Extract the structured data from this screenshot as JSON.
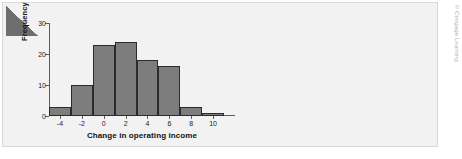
{
  "figure": {
    "credit": "© Cengage Learning",
    "corner_icon": "corner-wedge-icon"
  },
  "chart_data": {
    "type": "bar",
    "title": "",
    "subtitle": "",
    "xlabel": "Change in operating income",
    "ylabel": "Frequency",
    "categories": [
      "-5 to -3",
      "-3 to -1",
      "-1 to 1",
      "1 to 3",
      "3 to 5",
      "5 to 7",
      "7 to 9",
      "9 to 11"
    ],
    "bin_edges": [
      -5,
      -3,
      -1,
      1,
      3,
      5,
      7,
      9,
      11
    ],
    "values": [
      3,
      10,
      23,
      24,
      18,
      16,
      3,
      1
    ],
    "x_ticks": [
      -4,
      -2,
      0,
      2,
      4,
      6,
      8,
      10
    ],
    "x_tick_labels": [
      "-4",
      "-2",
      "0",
      "2",
      "4",
      "6",
      "8",
      "10"
    ],
    "y_ticks": [
      0,
      10,
      20,
      30
    ],
    "y_tick_labels": [
      "0",
      "10",
      "20",
      "30"
    ],
    "xlim": [
      -5,
      12
    ],
    "ylim": [
      0,
      30
    ],
    "grid": false,
    "legend": null,
    "bar_color": "#7d7d7d",
    "bar_edge_color": "#2b2b2b",
    "panel_color": "#f2f2f2",
    "axis_color": "#5c5c5c"
  }
}
